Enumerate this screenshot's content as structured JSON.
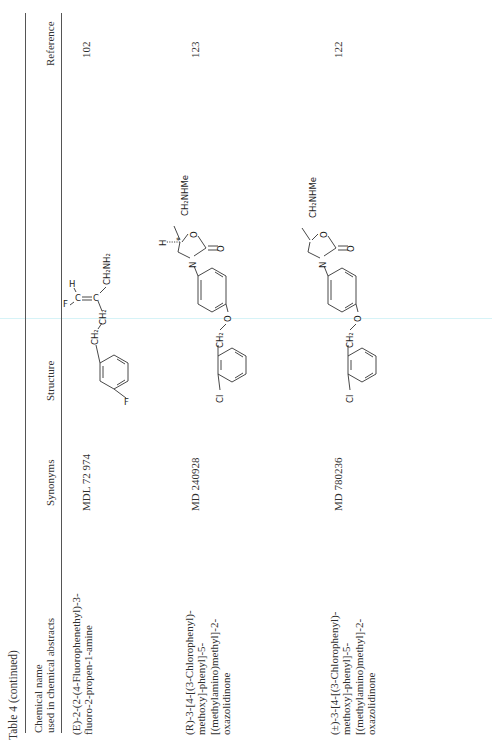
{
  "page": {
    "orientation": "rotated 90 degrees counter-clockwise",
    "caption": "Table 4 (continued)"
  },
  "table": {
    "headers": {
      "chemical_name_line1": "Chemical name",
      "chemical_name_line2": "used in chemical abstracts",
      "synonyms": "Synonyms",
      "structure": "Structure",
      "reference": "Reference"
    },
    "rows": [
      {
        "chemical_name": [
          "(E)-2-(2-(4-Fluorophenethyl)-3-",
          "fluoro-2-propen-1-amine"
        ],
        "synonym": "MDL 72 974",
        "structure": {
          "labels": [
            "F",
            "CH2",
            "CH2",
            "F",
            "C",
            "C",
            "H",
            "CH2NH2"
          ],
          "description": "4-fluorophenyl-CH2-CH2-C(=CHF)-CH2NH2"
        },
        "reference": "102"
      },
      {
        "chemical_name": [
          "(R)-3-[4-[(3-Chlorophenyl)-",
          "methoxy]-phenyl]-5-",
          "[(methylamino)methyl]-2-",
          "oxazolidinone"
        ],
        "synonym": "MD 240928",
        "structure": {
          "labels": [
            "Cl",
            "CH2",
            "O",
            "N",
            "O",
            "O",
            "H",
            "*",
            "CH2NHMe"
          ],
          "description": "3-chlorobenzyloxy-phenyl oxazolidinone, (R) stereocenter"
        },
        "reference": "123"
      },
      {
        "chemical_name": [
          "(±)-3-[4-[(3-Chlorophenyl)-",
          "methoxy]-phenyl]-5-",
          "[(methylamino)methyl]-2-",
          "oxazolidinone"
        ],
        "synonym": "MD 780236",
        "structure": {
          "labels": [
            "Cl",
            "CH2",
            "O",
            "N",
            "O",
            "O",
            "CH2NHMe"
          ],
          "description": "3-chlorobenzyloxy-phenyl oxazolidinone, racemic"
        },
        "reference": "122"
      }
    ]
  }
}
